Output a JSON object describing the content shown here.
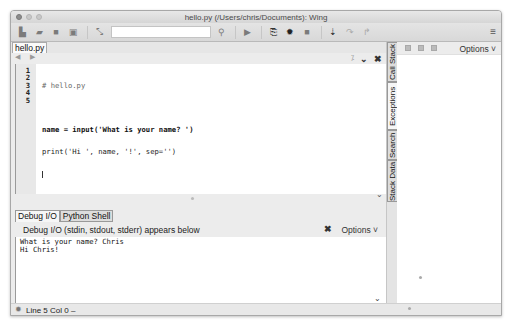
{
  "window": {
    "title": "hello.py (/Users/chris/Documents): Wing"
  },
  "toolbar": {
    "icons": [
      "new-file-icon",
      "open-folder-icon",
      "save-icon",
      "save-all-icon",
      "indent-icon",
      "search-icon",
      "run-icon",
      "step-into-file-icon",
      "debug-bug-icon",
      "stop-icon",
      "step-icon",
      "step-over-icon",
      "step-out-icon",
      "hamburger-menu-icon"
    ],
    "search_value": "",
    "menu_glyph": "≡"
  },
  "editor": {
    "file_tab": "hello.py",
    "nav_glyph": "◀ ▶",
    "line_numbers": [
      "1",
      "2",
      "3",
      "4",
      "5"
    ],
    "lines": [
      "# hello.py",
      "",
      "name = input('What is your name? ')",
      "print('Hi ', name, '!', sep='')",
      ""
    ],
    "cursor": {
      "line": 5,
      "col": 0
    }
  },
  "tools_panel": {
    "tabs": [
      {
        "label": "Debug I/O",
        "active": true
      },
      {
        "label": "Python Shell",
        "active": false
      }
    ],
    "header": "Debug I/O (stdin, stdout, stderr) appears below",
    "close_glyph": "✖",
    "options_label": "Options ˅",
    "output": "What is your name? Chris\nHi Chris!"
  },
  "vertical_tabs": [
    {
      "label": "Call Stack",
      "active": false
    },
    {
      "label": "Exceptions",
      "active": true
    },
    {
      "label": "Search",
      "active": false
    },
    {
      "label": "Stack Data",
      "active": false
    }
  ],
  "right_pane": {
    "options_label": "Options ˅"
  },
  "statusbar": {
    "text": "Line 5 Col 0 –"
  }
}
